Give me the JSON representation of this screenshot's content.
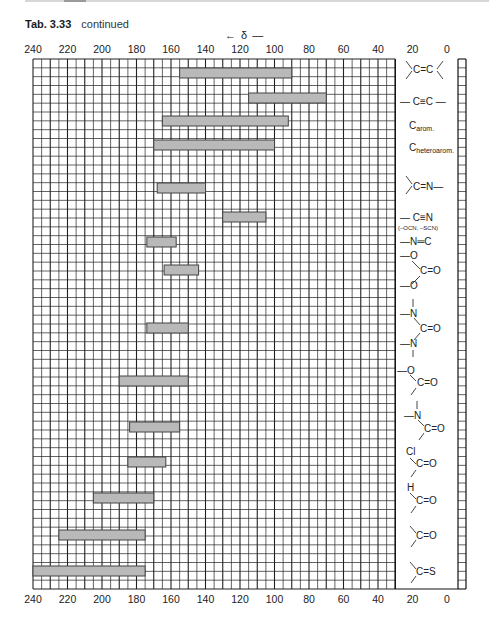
{
  "header": {
    "table_label": "Tab. 3.33",
    "continued": "continued",
    "axis_direction": "← δ —"
  },
  "chart_data": {
    "type": "bar",
    "orientation": "horizontal-range",
    "xlabel": "δ",
    "x_direction": "decreasing left-to-right",
    "xlim": [
      240,
      0
    ],
    "xticks": [
      240,
      220,
      200,
      180,
      160,
      140,
      120,
      100,
      80,
      60,
      40,
      20,
      0
    ],
    "grid": true,
    "series": [
      {
        "label": ">C=C<",
        "from": 155,
        "to": 90
      },
      {
        "label": "-C≡C-",
        "from": 115,
        "to": 70
      },
      {
        "label": "C arom.",
        "from": 165,
        "to": 92
      },
      {
        "label": "C heteroarom.",
        "from": 170,
        "to": 100
      },
      {
        "label": ">C=N-",
        "from": 168,
        "to": 140
      },
      {
        "label": "-C≡N (-OCN, -SCN)",
        "from": 130,
        "to": 105
      },
      {
        "label": "-N=C",
        "from": 174,
        "to": 157
      },
      {
        "label": "(-O)2C=O",
        "from": 164,
        "to": 144
      },
      {
        "label": "(-N<)2C=O",
        "from": 174,
        "to": 150
      },
      {
        "label": "-O-C(=O)-",
        "from": 190,
        "to": 150
      },
      {
        "label": ">N-C(=O)-",
        "from": 184,
        "to": 155
      },
      {
        "label": "Cl-C(=O)-",
        "from": 185,
        "to": 163
      },
      {
        "label": "H-C(=O)-",
        "from": 205,
        "to": 170
      },
      {
        "label": ">C=O",
        "from": 225,
        "to": 175
      },
      {
        "label": ">C=S",
        "from": 240,
        "to": 175
      }
    ]
  },
  "labels": {
    "alkene": "C=C",
    "alkyne": "— C≡C —",
    "arom_c": "C",
    "arom_sub": "arom.",
    "hetarom_c": "C",
    "hetarom_sub": "heteroarom.",
    "imine": "C=N—",
    "nitrile": "— C≡N",
    "nitrile_note": "(–OCN, –SCN)",
    "isonitrile": "—N═C",
    "carbonate_o1": "—O",
    "carbonate_co": "C=O",
    "carbonate_o2": "—O",
    "urea_n1": "—N",
    "urea_co": "C=O",
    "urea_n2": "—N",
    "ester_o": "—O",
    "ester_co": "C=O",
    "amide_n": "—N",
    "amide_co": "C=O",
    "acyl_cl": "Cl",
    "acyl_co": "C=O",
    "ald_h": "H",
    "ald_co": "C=O",
    "ketone": "C=O",
    "thione": "C=S"
  }
}
